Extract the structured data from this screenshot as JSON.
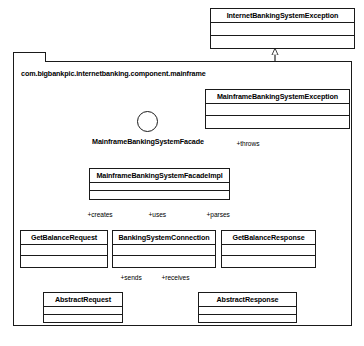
{
  "diagram": {
    "package": {
      "label": "com.bigbankpic.internetbanking.component.mainframe"
    },
    "interface": {
      "label": "MainframeBankingSystemFacade",
      "notation": "lollipop-interface-icon"
    },
    "classes": {
      "internet_exception": "InternetBankingSystemException",
      "mainframe_exception": "MainframeBankingSystemException",
      "facade_impl": "MainframeBankingSystemFacadeImpl",
      "get_balance_request": "GetBalanceRequest",
      "banking_system_connection": "BankingSystemConnection",
      "get_balance_response": "GetBalanceResponse",
      "abstract_request": "AbstractRequest",
      "abstract_response": "AbstractResponse"
    },
    "edge_labels": {
      "throws": "+throws",
      "creates": "+creates",
      "uses": "+uses",
      "parses": "+parses",
      "sends": "+sends",
      "receives": "+receives"
    },
    "colors": {
      "stroke": "#1a1a1a",
      "fill": "#ffffff",
      "text": "#000000"
    }
  }
}
